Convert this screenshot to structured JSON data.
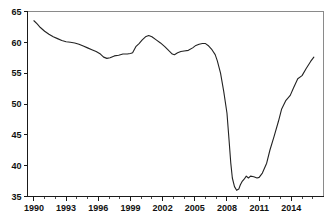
{
  "chart_data": {
    "type": "line",
    "title": "",
    "subtitle": "",
    "xlabel": "",
    "ylabel": "",
    "xlim": [
      1989.4,
      2017.0
    ],
    "ylim": [
      35,
      65
    ],
    "grid": false,
    "legend_position": "none",
    "line_color": "#222222",
    "y_ticks": [
      35,
      40,
      45,
      50,
      55,
      60,
      65
    ],
    "y_tick_labels": [
      "35",
      "40",
      "45",
      "50",
      "55",
      "60",
      "65"
    ],
    "x_ticks_major": [
      1990,
      1993,
      1996,
      1999,
      2002,
      2005,
      2008,
      2011,
      2014
    ],
    "x_tick_labels": [
      "1990",
      "1993",
      "1996",
      "1999",
      "2002",
      "2005",
      "2008",
      "2011",
      "2014"
    ],
    "x_ticks_minor": [
      1991,
      1992,
      1994,
      1995,
      1997,
      1998,
      2000,
      2001,
      2003,
      2004,
      2006,
      2007,
      2009,
      2010,
      2012,
      2013,
      2015,
      2016
    ],
    "series": [
      {
        "name": "series-1",
        "x": [
          1990.0,
          1990.3,
          1990.6,
          1991.0,
          1991.4,
          1991.8,
          1992.2,
          1992.6,
          1993.0,
          1993.4,
          1993.8,
          1994.2,
          1994.6,
          1995.0,
          1995.4,
          1995.8,
          1996.2,
          1996.5,
          1996.8,
          1997.1,
          1997.5,
          1997.9,
          1998.3,
          1998.7,
          1999.0,
          1999.2,
          1999.5,
          1999.8,
          2000.1,
          2000.4,
          2000.7,
          2001.0,
          2001.4,
          2001.8,
          2002.2,
          2002.6,
          2002.9,
          2003.1,
          2003.4,
          2003.7,
          2004.0,
          2004.4,
          2004.8,
          2005.1,
          2005.4,
          2005.7,
          2006.0,
          2006.3,
          2006.6,
          2006.9,
          2007.1,
          2007.4,
          2007.7,
          2008.0,
          2008.2,
          2008.35,
          2008.5,
          2008.7,
          2008.9,
          2009.1,
          2009.25,
          2009.4,
          2009.6,
          2009.8,
          2010.0,
          2010.2,
          2010.5,
          2010.8,
          2011.0,
          2011.3,
          2011.7,
          2012.0,
          2012.4,
          2012.8,
          2013.1,
          2013.5,
          2013.9,
          2014.2,
          2014.6,
          2015.0,
          2015.4,
          2015.8,
          2016.1
        ],
        "values": [
          63.5,
          63.0,
          62.4,
          61.8,
          61.3,
          60.9,
          60.6,
          60.3,
          60.1,
          60.0,
          59.9,
          59.7,
          59.4,
          59.1,
          58.8,
          58.5,
          58.1,
          57.6,
          57.4,
          57.5,
          57.8,
          57.9,
          58.1,
          58.1,
          58.2,
          58.3,
          59.3,
          59.8,
          60.4,
          60.9,
          61.1,
          60.9,
          60.4,
          59.9,
          59.3,
          58.6,
          58.1,
          58.0,
          58.3,
          58.5,
          58.6,
          58.7,
          59.1,
          59.5,
          59.7,
          59.8,
          59.8,
          59.4,
          58.8,
          58.0,
          57.0,
          55.0,
          52.0,
          48.5,
          44.0,
          40.5,
          38.0,
          36.6,
          36.0,
          36.2,
          36.9,
          37.4,
          37.8,
          38.3,
          38.0,
          38.3,
          38.2,
          38.0,
          38.1,
          38.8,
          40.4,
          42.5,
          44.8,
          47.2,
          49.2,
          50.6,
          51.4,
          52.6,
          54.1,
          54.6,
          55.8,
          56.9,
          57.6
        ]
      }
    ]
  }
}
